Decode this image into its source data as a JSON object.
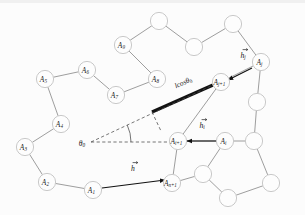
{
  "figure": {
    "width": 305,
    "height": 215,
    "background_color": "#fcfcfc",
    "node_fill": "#fdfdfd",
    "node_stroke": "#c9c9c9",
    "bond_color": "#8d8d8d",
    "thick_segment_color": "#121212",
    "dashed_color": "#4a4a4a",
    "vector_color": "#111111"
  },
  "nodes": [
    {
      "id": "n1",
      "label": "A",
      "sub": "1",
      "x": 93,
      "y": 190,
      "labeled": true
    },
    {
      "id": "n2",
      "label": "A",
      "sub": "2",
      "x": 47,
      "y": 182,
      "labeled": true
    },
    {
      "id": "n3",
      "label": "A",
      "sub": "3",
      "x": 25,
      "y": 147,
      "labeled": true
    },
    {
      "id": "n4",
      "label": "A",
      "sub": "4",
      "x": 61,
      "y": 124,
      "labeled": true
    },
    {
      "id": "n5",
      "label": "A",
      "sub": "5",
      "x": 45,
      "y": 79,
      "labeled": true
    },
    {
      "id": "n6",
      "label": "A",
      "sub": "6",
      "x": 87,
      "y": 70,
      "labeled": true
    },
    {
      "id": "n7",
      "label": "A",
      "sub": "7",
      "x": 116,
      "y": 95,
      "labeled": true
    },
    {
      "id": "n8",
      "label": "A",
      "sub": "8",
      "x": 157,
      "y": 79,
      "labeled": true
    },
    {
      "id": "n9",
      "label": "A",
      "sub": "9",
      "x": 123,
      "y": 45,
      "labeled": true
    },
    {
      "id": "n10",
      "label": "",
      "sub": "",
      "x": 159,
      "y": 21,
      "labeled": false
    },
    {
      "id": "n11",
      "label": "",
      "sub": "",
      "x": 194,
      "y": 47,
      "labeled": false
    },
    {
      "id": "n12",
      "label": "",
      "sub": "",
      "x": 233,
      "y": 24,
      "labeled": false
    },
    {
      "id": "n13",
      "label": "A",
      "sub": "j",
      "x": 261,
      "y": 62,
      "labeled": true
    },
    {
      "id": "n14",
      "label": "A",
      "sub": "j+1",
      "x": 221,
      "y": 82,
      "labeled": true
    },
    {
      "id": "n15",
      "label": "",
      "sub": "",
      "x": 257,
      "y": 102,
      "labeled": false
    },
    {
      "id": "n16",
      "label": "",
      "sub": "",
      "x": 254,
      "y": 141,
      "labeled": false
    },
    {
      "id": "n17",
      "label": "A",
      "sub": "i",
      "x": 225,
      "y": 141,
      "labeled": true
    },
    {
      "id": "n18",
      "label": "A",
      "sub": "i+1",
      "x": 178,
      "y": 141,
      "labeled": true
    },
    {
      "id": "n19",
      "label": "A",
      "sub": "n+1",
      "x": 172,
      "y": 183,
      "labeled": true
    },
    {
      "id": "n20",
      "label": "",
      "sub": "",
      "x": 203,
      "y": 174,
      "labeled": false
    },
    {
      "id": "n21",
      "label": "",
      "sub": "",
      "x": 228,
      "y": 198,
      "labeled": false
    },
    {
      "id": "n22",
      "label": "",
      "sub": "",
      "x": 271,
      "y": 183,
      "labeled": false
    }
  ],
  "bonds": [
    {
      "from": "n1",
      "to": "n2"
    },
    {
      "from": "n2",
      "to": "n3"
    },
    {
      "from": "n3",
      "to": "n4"
    },
    {
      "from": "n4",
      "to": "n5"
    },
    {
      "from": "n5",
      "to": "n6"
    },
    {
      "from": "n6",
      "to": "n7"
    },
    {
      "from": "n7",
      "to": "n8"
    },
    {
      "from": "n8",
      "to": "n9"
    },
    {
      "from": "n9",
      "to": "n10"
    },
    {
      "from": "n10",
      "to": "n11"
    },
    {
      "from": "n11",
      "to": "n12"
    },
    {
      "from": "n12",
      "to": "n13"
    },
    {
      "from": "n13",
      "to": "n14"
    },
    {
      "from": "n13",
      "to": "n15"
    },
    {
      "from": "n15",
      "to": "n16"
    },
    {
      "from": "n16",
      "to": "n17"
    },
    {
      "from": "n14",
      "to": "n18"
    },
    {
      "from": "n17",
      "to": "n18"
    },
    {
      "from": "n18",
      "to": "n19"
    },
    {
      "from": "n17",
      "to": "n20"
    },
    {
      "from": "n20",
      "to": "n21"
    },
    {
      "from": "n21",
      "to": "n22"
    },
    {
      "from": "n22",
      "to": "n16"
    },
    {
      "from": "n19",
      "to": "n20"
    }
  ],
  "thick_segment": {
    "name": "projection-segment",
    "x1": 152,
    "y1": 112,
    "x2": 213,
    "y2": 85,
    "label": "lcos",
    "label_symbol": "θ",
    "label_sub": "0",
    "label_x": 183,
    "label_y": 82
  },
  "angle": {
    "vertex_label": "θ",
    "vertex_sub": "0",
    "vertex_x": 91,
    "vertex_y": 142,
    "label_x": 82,
    "label_y": 143,
    "ray_upper_to_x": 213,
    "ray_upper_to_y": 85,
    "ray_lower_to_x": 176,
    "ray_lower_to_y": 142,
    "perpendicular_from_x": 152,
    "perpendicular_from_y": 112,
    "perpendicular_to_x": 161,
    "perpendicular_to_y": 131
  },
  "vectors": [
    {
      "id": "v-hj",
      "label": "h",
      "sub": "j",
      "accent": "arrow",
      "from_x": 252,
      "from_y": 68,
      "to_x": 228,
      "to_y": 80,
      "label_x": 243,
      "label_y": 55
    },
    {
      "id": "v-hi",
      "label": "h",
      "sub": "i",
      "accent": "arrow",
      "from_x": 216,
      "from_y": 141,
      "to_x": 187,
      "to_y": 141,
      "label_x": 202,
      "label_y": 125
    },
    {
      "id": "v-h",
      "label": "h",
      "sub": "",
      "accent": "arrow",
      "from_x": 102,
      "from_y": 188,
      "to_x": 165,
      "to_y": 180,
      "label_x": 133,
      "label_y": 168
    }
  ],
  "legend": {
    "node_radius": 8.6,
    "vector_note": "h-vectors shown with overset arrow accents"
  }
}
